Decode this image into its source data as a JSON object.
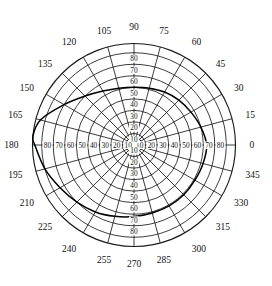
{
  "chart_data": {
    "type": "line",
    "coordinate_system": "polar",
    "title": "",
    "xlabel": "",
    "ylabel": "",
    "angular_axis": {
      "unit": "degrees",
      "start": 0,
      "step": 15,
      "direction": "counterclockwise",
      "zero_at": "east",
      "tick_labels": [
        "0",
        "15",
        "30",
        "45",
        "60",
        "75",
        "90",
        "105",
        "120",
        "135",
        "150",
        "165",
        "180",
        "195",
        "210",
        "225",
        "240",
        "255",
        "270",
        "285",
        "300",
        "315",
        "330",
        "345"
      ],
      "tick_values": [
        0,
        15,
        30,
        45,
        60,
        75,
        90,
        105,
        120,
        135,
        150,
        165,
        180,
        195,
        210,
        225,
        240,
        255,
        270,
        285,
        300,
        315,
        330,
        345
      ]
    },
    "radial_axis": {
      "rlim": [
        0,
        88
      ],
      "ring_values": [
        10,
        20,
        30,
        40,
        50,
        60,
        70,
        80
      ],
      "tick_labels": [
        "10",
        "20",
        "30",
        "40",
        "50",
        "60",
        "70",
        "80"
      ],
      "labeled_directions": [
        "0",
        "90",
        "180",
        "270"
      ],
      "grid": true
    },
    "series": [
      {
        "name": "curve",
        "color": "#000000",
        "theta": [
          0,
          15,
          30,
          45,
          60,
          75,
          90,
          105,
          120,
          135,
          150,
          165,
          175,
          180,
          195,
          210,
          225,
          240,
          255,
          270,
          285,
          300,
          315,
          330,
          345,
          360
        ],
        "r": [
          63,
          60,
          57,
          55,
          53,
          51,
          50,
          51,
          54,
          60,
          70,
          84,
          88,
          86,
          80,
          74,
          70,
          67,
          64,
          62,
          61,
          61,
          61,
          61,
          62,
          63
        ]
      }
    ],
    "legend": {
      "visible": false,
      "position": "none",
      "entries": []
    },
    "annotations": [],
    "center_marker": "open-circle",
    "colors": {
      "grid": "#1a1a1a",
      "curve": "#000000",
      "background": "#ffffff"
    }
  },
  "labels": {
    "angles": [
      {
        "text": "0",
        "deg": 0
      },
      {
        "text": "15",
        "deg": 15
      },
      {
        "text": "30",
        "deg": 30
      },
      {
        "text": "45",
        "deg": 45
      },
      {
        "text": "60",
        "deg": 60
      },
      {
        "text": "75",
        "deg": 75
      },
      {
        "text": "90",
        "deg": 90
      },
      {
        "text": "105",
        "deg": 105
      },
      {
        "text": "120",
        "deg": 120
      },
      {
        "text": "135",
        "deg": 135
      },
      {
        "text": "150",
        "deg": 150
      },
      {
        "text": "165",
        "deg": 165
      },
      {
        "text": "180",
        "deg": 180
      },
      {
        "text": "195",
        "deg": 195
      },
      {
        "text": "210",
        "deg": 210
      },
      {
        "text": "225",
        "deg": 225
      },
      {
        "text": "240",
        "deg": 240
      },
      {
        "text": "255",
        "deg": 255
      },
      {
        "text": "270",
        "deg": 270
      },
      {
        "text": "285",
        "deg": 285
      },
      {
        "text": "300",
        "deg": 300
      },
      {
        "text": "315",
        "deg": 315
      },
      {
        "text": "330",
        "deg": 330
      },
      {
        "text": "345",
        "deg": 345
      }
    ],
    "radials": [
      "10",
      "20",
      "30",
      "40",
      "50",
      "60",
      "70",
      "80"
    ]
  }
}
